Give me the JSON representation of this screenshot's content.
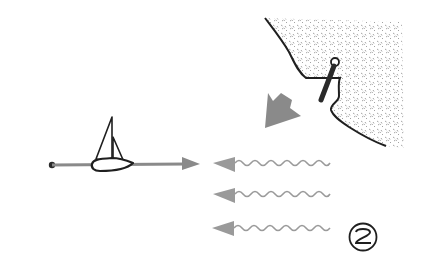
{
  "figure": {
    "step_number": "2",
    "colors": {
      "background": "#ffffff",
      "ink": "#1f1f1f",
      "arrow_gray": "#8a8a8a",
      "wave_gray": "#9a9a9a",
      "stipple": "#8c8c8c"
    },
    "elements": {
      "boat": "sailboat-icon",
      "course": "course-line-arrow",
      "start": "start-point-dot",
      "shore": "stippled-shoreline",
      "anchor": "mooring-post",
      "wind_arrow": "wind-direction-arrow",
      "waves": [
        "wave-arrow",
        "wave-arrow",
        "wave-arrow"
      ]
    }
  }
}
